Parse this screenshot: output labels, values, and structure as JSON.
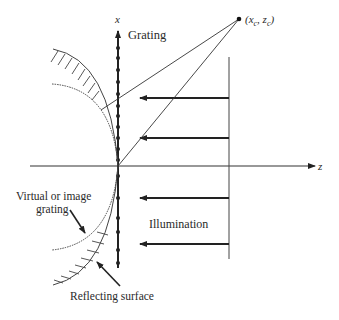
{
  "diagram": {
    "axes": {
      "x_label": "x",
      "z_label": "z"
    },
    "labels": {
      "grating": "Grating",
      "point": "(x",
      "point_sub_c1": "c",
      "point_mid": ", z",
      "point_sub_c2": "c",
      "point_end": ")",
      "illumination": "Illumination",
      "virtual_line1": "Virtual or image",
      "virtual_line2": "grating",
      "reflecting": "Reflecting surface"
    },
    "colors": {
      "stroke": "#333333",
      "text": "#2a2a2a"
    }
  }
}
